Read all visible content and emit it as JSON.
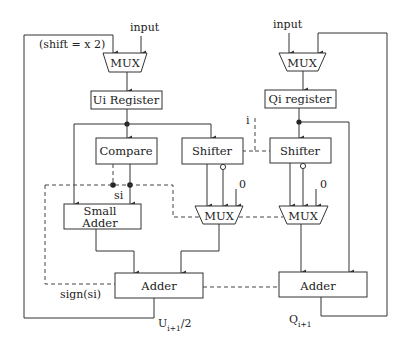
{
  "diagram": {
    "type": "block-diagram",
    "left_path": {
      "input_label": "input",
      "feedback_label": "(shift = x 2)",
      "mux_label": "MUX",
      "register_label": "Ui Register",
      "compare_label": "Compare",
      "shifter_label": "Shifter",
      "small_adder_line1": "Small",
      "small_adder_line2": "Adder",
      "mux2_label": "MUX",
      "zero_label": "0",
      "si_label": "si",
      "adder_label": "Adder",
      "sign_label": "sign(si)",
      "output_label_main": "U",
      "output_label_sub": "i+1",
      "output_label_suffix": "/2"
    },
    "right_path": {
      "input_label": "input",
      "mux_label": "MUX",
      "register_label": "Qi register",
      "shifter_label": "Shifter",
      "mux2_label": "MUX",
      "zero_label": "0",
      "index_label": "i",
      "adder_label": "Adder",
      "output_label_main": "Q",
      "output_label_sub": "i+1"
    },
    "colors": {
      "line": "#333333",
      "background": "#ffffff"
    }
  }
}
